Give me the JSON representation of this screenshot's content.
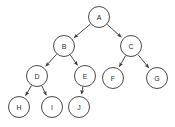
{
  "diagram": {
    "type": "directed-tree",
    "background_color": "#ffffff",
    "node_stroke_color": "#4a4a4a",
    "node_fill_color": "#ffffff",
    "edge_color": "#4a4a4a",
    "label_color": "#2b2b2b",
    "node_radius": 10.5,
    "root": "A",
    "nodes": [
      {
        "id": "A",
        "label": "A",
        "x": 99,
        "y": 17,
        "level": 0
      },
      {
        "id": "B",
        "label": "B",
        "x": 64,
        "y": 46,
        "level": 1
      },
      {
        "id": "C",
        "label": "C",
        "x": 131,
        "y": 46,
        "level": 1
      },
      {
        "id": "D",
        "label": "D",
        "x": 37,
        "y": 76,
        "level": 2
      },
      {
        "id": "E",
        "label": "E",
        "x": 85,
        "y": 76,
        "level": 2
      },
      {
        "id": "F",
        "label": "F",
        "x": 113,
        "y": 78,
        "level": 2
      },
      {
        "id": "G",
        "label": "G",
        "x": 157,
        "y": 78,
        "level": 2
      },
      {
        "id": "H",
        "label": "H",
        "x": 19,
        "y": 107,
        "level": 3
      },
      {
        "id": "I",
        "label": "I",
        "x": 52,
        "y": 107,
        "level": 3
      },
      {
        "id": "J",
        "label": "J",
        "x": 79,
        "y": 107,
        "level": 3
      }
    ],
    "edges": [
      {
        "from": "A",
        "to": "B",
        "directed": true
      },
      {
        "from": "A",
        "to": "C",
        "directed": true
      },
      {
        "from": "B",
        "to": "D",
        "directed": true
      },
      {
        "from": "B",
        "to": "E",
        "directed": true
      },
      {
        "from": "C",
        "to": "F",
        "directed": true
      },
      {
        "from": "C",
        "to": "G",
        "directed": true
      },
      {
        "from": "D",
        "to": "H",
        "directed": true
      },
      {
        "from": "D",
        "to": "I",
        "directed": true
      },
      {
        "from": "E",
        "to": "J",
        "directed": true
      }
    ]
  }
}
